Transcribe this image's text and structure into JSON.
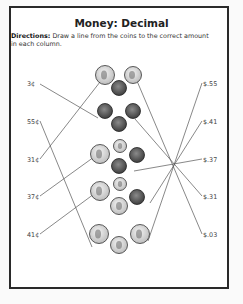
{
  "worksheet": {
    "title": "Money: Decimal",
    "directions_label": "Directions:",
    "directions_text": "Draw a line from the coins to the correct amount in each column.",
    "left_amounts": [
      "3¢",
      "55¢",
      "31¢",
      "37¢",
      "41¢"
    ],
    "right_amounts": [
      "$.55",
      "$.41",
      "$.37",
      "$.31",
      "$.03"
    ],
    "coin_groups": [
      {
        "coins": [
          "quarter",
          "quarter",
          "penny"
        ]
      },
      {
        "coins": [
          "penny",
          "penny",
          "penny"
        ]
      },
      {
        "coins": [
          "quarter",
          "dime",
          "penny",
          "penny"
        ]
      },
      {
        "coins": [
          "quarter",
          "dime",
          "penny",
          "nickel"
        ]
      },
      {
        "coins": [
          "quarter",
          "quarter",
          "nickel"
        ]
      }
    ],
    "colors": {
      "border": "#2a2a2a",
      "line": "#555555",
      "silver_coin": "#d8d8d8",
      "copper_coin": "#5a5a5a"
    }
  }
}
